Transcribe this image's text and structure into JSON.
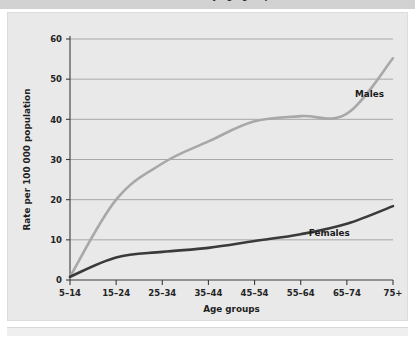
{
  "figure": {
    "caption": "Suicide rates by age groups",
    "caption_visible_partial": true
  },
  "chart_data": {
    "type": "line",
    "title": "Suicide rates by age groups",
    "xlabel": "Age groups",
    "ylabel": "Rate per 100 000 population",
    "categories": [
      "5–14",
      "15–24",
      "25–34",
      "35–44",
      "45–54",
      "55–64",
      "65–74",
      "75+"
    ],
    "ylim": [
      0,
      60
    ],
    "yticks": [
      0,
      10,
      20,
      30,
      40,
      50,
      60
    ],
    "grid": "horizontal",
    "legend_position": "inline-right",
    "series": [
      {
        "name": "Males",
        "color": "#a8a8a8",
        "line_width": 2.6,
        "values": [
          0.8,
          20.0,
          29.0,
          34.5,
          39.5,
          40.8,
          41.4,
          55.2
        ],
        "label_anchor": {
          "x_index": 7,
          "value": 45.5
        }
      },
      {
        "name": "Females",
        "color": "#3a3a3a",
        "line_width": 2.6,
        "values": [
          0.8,
          5.6,
          7.0,
          8.0,
          9.7,
          11.4,
          14.0,
          18.4
        ],
        "label_anchor": {
          "x_index": 6,
          "value": 11.0
        }
      }
    ]
  },
  "colors": {
    "panel_background": "#e9e9e9",
    "caption_background": "#d2d2d2",
    "axis": "#3c3c3c",
    "grid": "#8d8d8d",
    "males": "#a8a8a8",
    "females": "#3a3a3a",
    "page_background": "#ffffff"
  }
}
